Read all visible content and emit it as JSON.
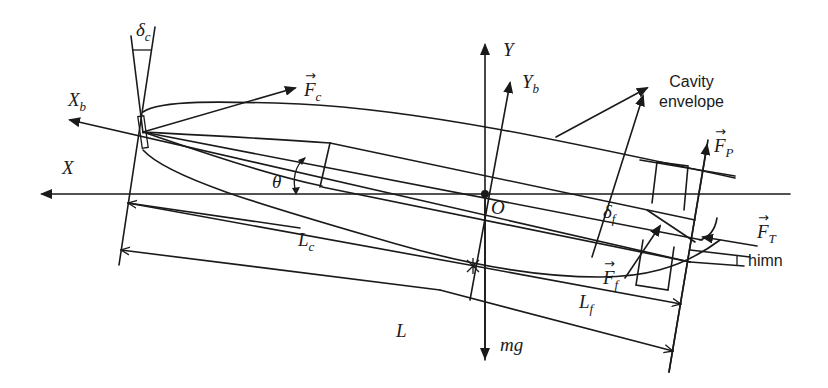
{
  "figure": {
    "type": "free-body diagram of supercavitating vehicle",
    "labels": {
      "delta_c": {
        "main": "δ",
        "sub": "c"
      },
      "X_b": {
        "main": "X",
        "sub": "b"
      },
      "X": {
        "main": "X"
      },
      "F_c": {
        "main": "F",
        "sub": "c",
        "vector": true
      },
      "Y": {
        "main": "Y"
      },
      "Y_b": {
        "main": "Y",
        "sub": "b"
      },
      "theta": {
        "main": "θ"
      },
      "O": {
        "main": "O"
      },
      "delta_f": {
        "main": "δ",
        "sub": "f"
      },
      "F_P": {
        "main": "F",
        "sub": "P",
        "vector": true
      },
      "F_T": {
        "main": "F",
        "sub": "T",
        "vector": true
      },
      "F_f": {
        "main": "F",
        "sub": "f",
        "vector": true
      },
      "L_c": {
        "main": "L",
        "sub": "c"
      },
      "L_f": {
        "main": "L",
        "sub": "f"
      },
      "L": {
        "main": "L"
      },
      "mg": {
        "main": "mg"
      },
      "cavity_envelope": {
        "line1": "Cavity",
        "line2": "envelope"
      },
      "himn": {
        "main": "himn"
      }
    },
    "colors": {
      "line": "#1a1a1a",
      "background": "#ffffff"
    }
  }
}
